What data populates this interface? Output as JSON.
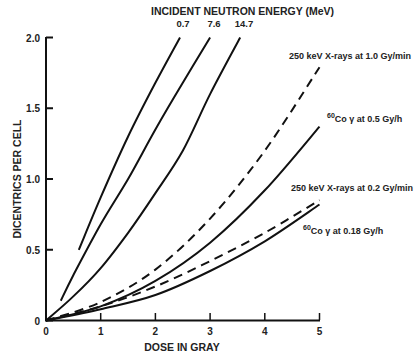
{
  "chart_data": {
    "type": "line",
    "title": "INCIDENT NEUTRON ENERGY (MeV)",
    "xlabel": "DOSE IN GRAY",
    "ylabel": "DICENTRICS PER CELL",
    "xlim": [
      0,
      5
    ],
    "ylim": [
      0,
      2.0
    ],
    "x_ticks": [
      "0",
      "1",
      "2",
      "3",
      "4",
      "5"
    ],
    "y_ticks": [
      "0",
      "0.5",
      "1.0",
      "1.5",
      "2.0"
    ],
    "grid": false,
    "legend_position": "inline labels",
    "series": [
      {
        "name": "0.7",
        "group": "neutron",
        "style": "solid",
        "x": [
          0.6,
          1.0,
          1.5,
          2.0,
          2.45
        ],
        "y": [
          0.5,
          0.87,
          1.3,
          1.68,
          2.0
        ]
      },
      {
        "name": "7.6",
        "group": "neutron",
        "style": "solid",
        "x": [
          0.27,
          0.5,
          1.0,
          1.5,
          2.0,
          2.5,
          3.0
        ],
        "y": [
          0.14,
          0.32,
          0.68,
          1.0,
          1.35,
          1.68,
          2.0
        ]
      },
      {
        "name": "14.7",
        "group": "neutron",
        "style": "solid",
        "x": [
          0,
          0.5,
          1.0,
          1.5,
          2.0,
          2.5,
          3.0,
          3.55
        ],
        "y": [
          0,
          0.17,
          0.37,
          0.62,
          0.9,
          1.2,
          1.6,
          2.0
        ]
      },
      {
        "name": "250 keV X-rays at 1.0 Gy/min",
        "group": "xray",
        "style": "dashed",
        "x": [
          0,
          1.0,
          2.0,
          3.0,
          4.0,
          5.0
        ],
        "y": [
          0,
          0.13,
          0.36,
          0.72,
          1.2,
          1.79
        ]
      },
      {
        "name": "60Co γ at 0.5 Gy/h",
        "group": "cobalt",
        "style": "solid",
        "x": [
          0,
          1.0,
          2.0,
          3.0,
          4.0,
          5.0
        ],
        "y": [
          0,
          0.1,
          0.28,
          0.55,
          0.92,
          1.37
        ]
      },
      {
        "name": "250 keV X-rays at 0.2 Gy/min",
        "group": "xray",
        "style": "dashed",
        "x": [
          0,
          1.0,
          2.0,
          3.0,
          4.0,
          5.0
        ],
        "y": [
          0,
          0.1,
          0.24,
          0.42,
          0.62,
          0.85
        ]
      },
      {
        "name": "60Co γ at 0.18 Gy/h",
        "group": "cobalt",
        "style": "solid",
        "x": [
          0,
          1.0,
          2.0,
          3.0,
          4.0,
          5.0
        ],
        "y": [
          0,
          0.08,
          0.18,
          0.35,
          0.56,
          0.82
        ]
      }
    ],
    "annotations": [
      {
        "text": "250 keV X-rays at 1.0 Gy/min",
        "sup": ""
      },
      {
        "text": "Co γ at 0.5 Gy/h",
        "sup": "60"
      },
      {
        "text": "250 keV X-rays at 0.2 Gy/min",
        "sup": ""
      },
      {
        "text": "Co γ at 0.18 Gy/h",
        "sup": "60"
      }
    ]
  }
}
